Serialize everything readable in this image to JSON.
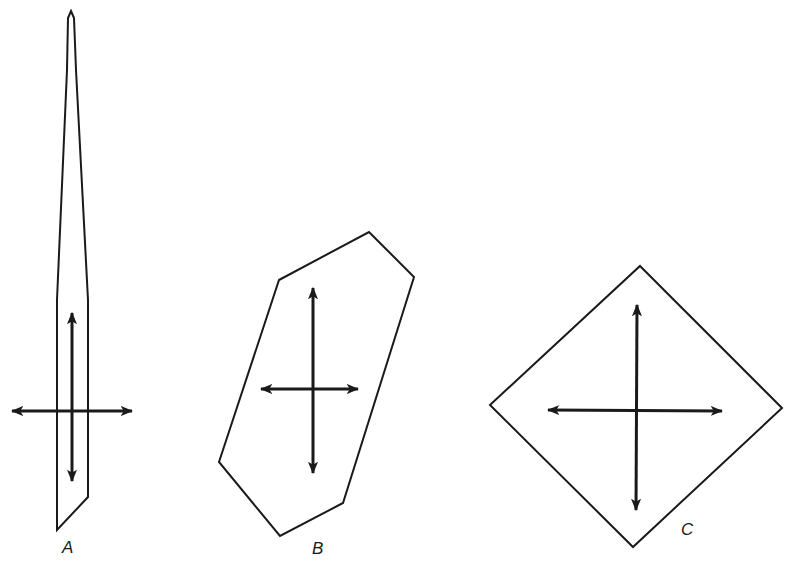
{
  "figure": {
    "shapes": [
      {
        "id": "A",
        "label": "A",
        "description": "elongated needle-shaped crystal with pointed top and oblique base",
        "outline_points": "71,11 74,18 76,70 88,300 88,497 57,530 57,300 67,70 68,18",
        "label_pos": [
          62,
          553
        ],
        "arrows": [
          {
            "orientation": "vertical",
            "x1": 72,
            "y1": 313,
            "x2": 72,
            "y2": 481
          },
          {
            "orientation": "horizontal",
            "x1": 12,
            "y1": 411,
            "x2": 132,
            "y2": 411
          }
        ]
      },
      {
        "id": "B",
        "label": "B",
        "description": "elongated hexagonal crystal section",
        "outline_points": "279,280 369,232 414,277 343,503 280,536 219,462",
        "label_pos": [
          312,
          554
        ],
        "arrows": [
          {
            "orientation": "vertical",
            "x1": 313,
            "y1": 288,
            "x2": 313,
            "y2": 473
          },
          {
            "orientation": "horizontal",
            "x1": 261,
            "y1": 389,
            "x2": 358,
            "y2": 389
          }
        ]
      },
      {
        "id": "C",
        "label": "C",
        "description": "rhombic (diamond) crystal section",
        "outline_points": "640,266 782,408 633,547 490,405",
        "label_pos": [
          681,
          535
        ],
        "arrows": [
          {
            "orientation": "vertical",
            "x1": 637,
            "y1": 305,
            "x2": 636,
            "y2": 510
          },
          {
            "orientation": "horizontal",
            "x1": 548,
            "y1": 410,
            "x2": 722,
            "y2": 411
          }
        ]
      }
    ],
    "colors": {
      "background": "#ffffff",
      "ink": "#1a1a1a"
    }
  }
}
